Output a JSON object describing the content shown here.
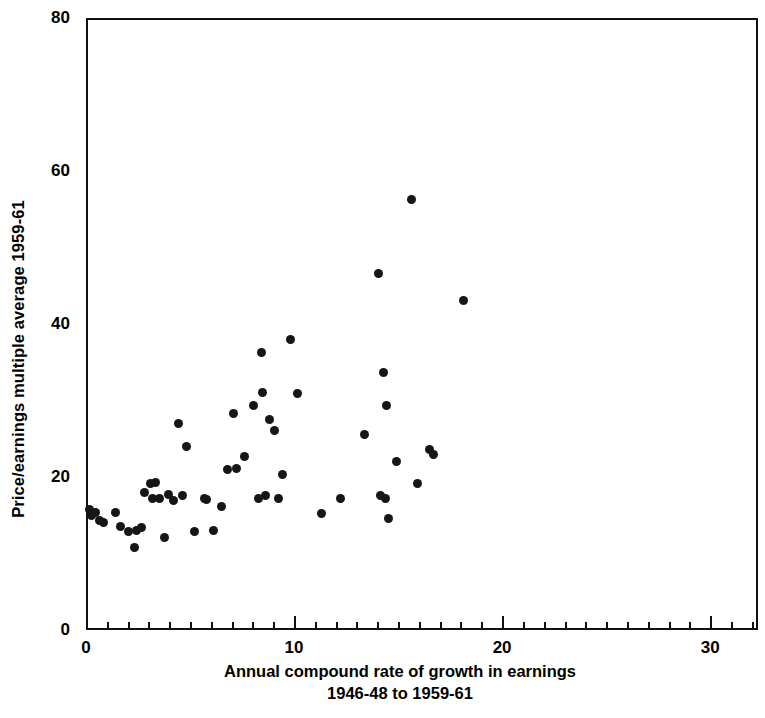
{
  "chart_data": {
    "type": "scatter",
    "title": "",
    "xlabel": "Annual compound rate of growth in earnings 1946-48 to 1959-61",
    "xlabel_line1": "Annual compound rate of growth in earnings",
    "xlabel_line2": "1946-48 to 1959-61",
    "ylabel": "Price/earnings multiple average 1959-61",
    "xlim": [
      0,
      32.3
    ],
    "ylim": [
      0,
      80
    ],
    "xticks": [
      0,
      10,
      20,
      30
    ],
    "xtick_labels": [
      "0",
      "10",
      "20",
      "30"
    ],
    "xticks_minor_step": 1,
    "yticks": [
      0,
      20,
      40,
      60,
      80
    ],
    "ytick_labels": [
      "0",
      "20",
      "40",
      "60",
      "80"
    ],
    "grid": false,
    "legend": null,
    "marker": "filled-circle",
    "marker_color": "#161616",
    "frame_color": "#111111",
    "background_color": "#ffffff",
    "n_points": 57,
    "points": [
      [
        0.05,
        16.0
      ],
      [
        0.15,
        15.2
      ],
      [
        0.35,
        15.6
      ],
      [
        0.55,
        14.6
      ],
      [
        0.75,
        14.3
      ],
      [
        1.3,
        15.6
      ],
      [
        1.55,
        13.8
      ],
      [
        1.95,
        13.2
      ],
      [
        2.25,
        11.0
      ],
      [
        2.35,
        13.3
      ],
      [
        2.55,
        13.6
      ],
      [
        2.7,
        18.2
      ],
      [
        3.0,
        19.4
      ],
      [
        3.1,
        17.4
      ],
      [
        3.25,
        19.6
      ],
      [
        3.45,
        17.5
      ],
      [
        3.7,
        12.4
      ],
      [
        3.85,
        18.0
      ],
      [
        4.1,
        17.2
      ],
      [
        4.35,
        27.2
      ],
      [
        4.55,
        17.8
      ],
      [
        4.75,
        24.3
      ],
      [
        5.1,
        13.2
      ],
      [
        5.6,
        17.4
      ],
      [
        5.7,
        17.3
      ],
      [
        6.05,
        13.3
      ],
      [
        6.4,
        16.4
      ],
      [
        6.7,
        21.2
      ],
      [
        7.0,
        28.6
      ],
      [
        7.15,
        21.4
      ],
      [
        7.5,
        23.0
      ],
      [
        7.95,
        29.6
      ],
      [
        8.2,
        17.5
      ],
      [
        8.35,
        36.5
      ],
      [
        8.4,
        31.3
      ],
      [
        8.55,
        17.8
      ],
      [
        8.7,
        27.8
      ],
      [
        8.95,
        26.4
      ],
      [
        9.15,
        17.5
      ],
      [
        9.35,
        20.6
      ],
      [
        9.75,
        38.3
      ],
      [
        10.05,
        31.2
      ],
      [
        11.2,
        15.5
      ],
      [
        12.15,
        17.4
      ],
      [
        13.3,
        25.8
      ],
      [
        13.95,
        46.8
      ],
      [
        14.05,
        17.9
      ],
      [
        14.2,
        33.9
      ],
      [
        14.3,
        17.4
      ],
      [
        14.35,
        29.6
      ],
      [
        14.45,
        14.9
      ],
      [
        14.85,
        22.3
      ],
      [
        15.55,
        56.6
      ],
      [
        15.85,
        19.4
      ],
      [
        16.4,
        23.8
      ],
      [
        16.6,
        23.2
      ],
      [
        18.05,
        43.3
      ]
    ]
  }
}
